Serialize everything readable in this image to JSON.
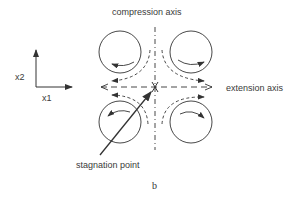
{
  "labels": {
    "compression_axis": "compression axis",
    "extension_axis": "extension axis",
    "stagnation_point": "stagnation point",
    "x1": "x1",
    "x2": "x2",
    "caption": "b"
  },
  "colors": {
    "stroke": "#333333"
  }
}
